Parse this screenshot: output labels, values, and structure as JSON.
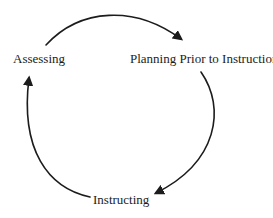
{
  "diagram": {
    "type": "cycle",
    "nodes": [
      {
        "id": "assessing",
        "label": "Assessing"
      },
      {
        "id": "planning",
        "label": "Planning Prior to Instruction"
      },
      {
        "id": "instructing",
        "label": "Instructing"
      }
    ],
    "edges": [
      {
        "from": "assessing",
        "to": "planning"
      },
      {
        "from": "planning",
        "to": "instructing"
      },
      {
        "from": "instructing",
        "to": "assessing"
      }
    ],
    "colors": {
      "background": "#ffffff",
      "line": "#1c1c1c",
      "text": "#1c1c1c"
    }
  }
}
